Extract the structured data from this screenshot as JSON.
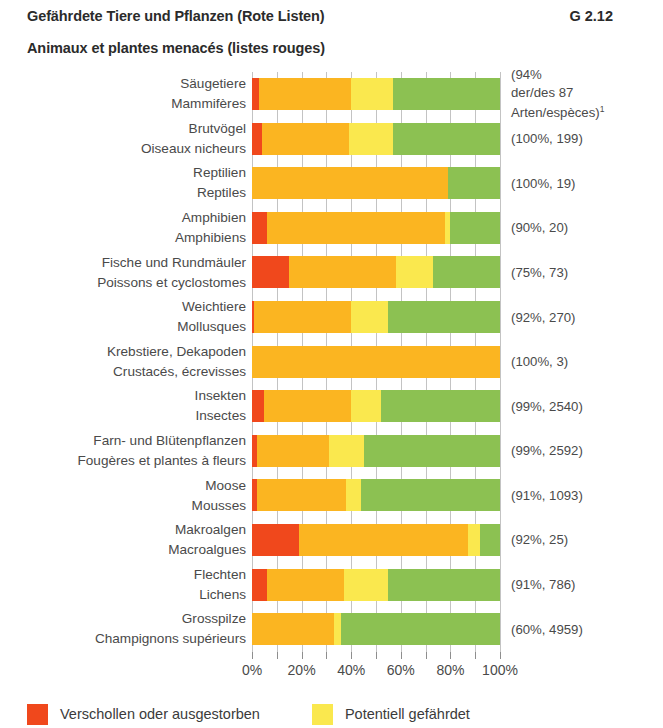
{
  "header": {
    "title_de": "Gefährdete Tiere und Pflanzen (Rote Listen)",
    "title_fr": "Animaux et plantes menacés (listes rouges)",
    "code": "G 2.12"
  },
  "chart_data": {
    "type": "bar",
    "orientation": "horizontal",
    "stacked": true,
    "title": "Gefährdete Tiere und Pflanzen (Rote Listen)",
    "subtitle": "Animaux et plantes menacés (listes rouges)",
    "xlabel": "",
    "ylabel": "",
    "xlim": [
      0,
      100
    ],
    "xticks": [
      0,
      20,
      40,
      60,
      80,
      100
    ],
    "xtick_labels": [
      "0%",
      "20%",
      "40%",
      "60%",
      "80%",
      "100%"
    ],
    "grid": true,
    "legend_position": "bottom",
    "units": "percent",
    "series": [
      {
        "name": "Verschollen oder ausgestorben",
        "color": "#f0481c"
      },
      {
        "name": "Gefährdet",
        "color": "#fbb521"
      },
      {
        "name": "Potentiell gefährdet",
        "color": "#fae84e"
      },
      {
        "name": "Nicht gefährdet",
        "color": "#8cc152"
      }
    ],
    "categories": [
      {
        "label_de": "Säugetiere",
        "label_fr": "Mammifères",
        "note_lines": [
          "(94%",
          "der/des 87",
          "Arten/espèces)"
        ],
        "note_superscript": "1",
        "values": [
          3,
          37,
          17,
          43
        ]
      },
      {
        "label_de": "Brutvögel",
        "label_fr": "Oiseaux nicheurs",
        "note_lines": [
          "(100%, 199)"
        ],
        "note_superscript": "",
        "values": [
          4,
          35,
          18,
          43
        ]
      },
      {
        "label_de": "Reptilien",
        "label_fr": "Reptiles",
        "note_lines": [
          "(100%, 19)"
        ],
        "note_superscript": "",
        "values": [
          0,
          79,
          0,
          21
        ]
      },
      {
        "label_de": "Amphibien",
        "label_fr": "Amphibiens",
        "note_lines": [
          "(90%, 20)"
        ],
        "note_superscript": "",
        "values": [
          6,
          72,
          2,
          20
        ]
      },
      {
        "label_de": "Fische und Rundmäuler",
        "label_fr": "Poissons et cyclostomes",
        "note_lines": [
          "(75%, 73)"
        ],
        "note_superscript": "",
        "values": [
          15,
          43,
          15,
          27
        ]
      },
      {
        "label_de": "Weichtiere",
        "label_fr": "Mollusques",
        "note_lines": [
          "(92%, 270)"
        ],
        "note_superscript": "",
        "values": [
          1,
          39,
          15,
          45
        ]
      },
      {
        "label_de": "Krebstiere, Dekapoden",
        "label_fr": "Crustacés, écrevisses",
        "note_lines": [
          "(100%, 3)"
        ],
        "note_superscript": "",
        "values": [
          0,
          100,
          0,
          0
        ]
      },
      {
        "label_de": "Insekten",
        "label_fr": "Insectes",
        "note_lines": [
          "(99%, 2540)"
        ],
        "note_superscript": "",
        "values": [
          5,
          35,
          12,
          48
        ]
      },
      {
        "label_de": "Farn- und Blütenpflanzen",
        "label_fr": "Fougères et plantes à fleurs",
        "note_lines": [
          "(99%, 2592)"
        ],
        "note_superscript": "",
        "values": [
          2,
          29,
          14,
          55
        ]
      },
      {
        "label_de": "Moose",
        "label_fr": "Mousses",
        "note_lines": [
          "(91%, 1093)"
        ],
        "note_superscript": "",
        "values": [
          2,
          36,
          6,
          56
        ]
      },
      {
        "label_de": "Makroalgen",
        "label_fr": "Macroalgues",
        "note_lines": [
          "(92%, 25)"
        ],
        "note_superscript": "",
        "values": [
          19,
          68,
          5,
          8
        ]
      },
      {
        "label_de": "Flechten",
        "label_fr": "Lichens",
        "note_lines": [
          "(91%, 786)"
        ],
        "note_superscript": "",
        "values": [
          6,
          31,
          18,
          45
        ]
      },
      {
        "label_de": "Grosspilze",
        "label_fr": "Champignons supérieurs",
        "note_lines": [
          "(60%, 4959)"
        ],
        "note_superscript": "",
        "values": [
          0,
          33,
          3,
          64
        ]
      }
    ]
  },
  "legend": [
    {
      "label": "Verschollen oder ausgestorben",
      "color": "#f0481c"
    },
    {
      "label": "Potentiell gefährdet",
      "color": "#fae84e"
    }
  ]
}
